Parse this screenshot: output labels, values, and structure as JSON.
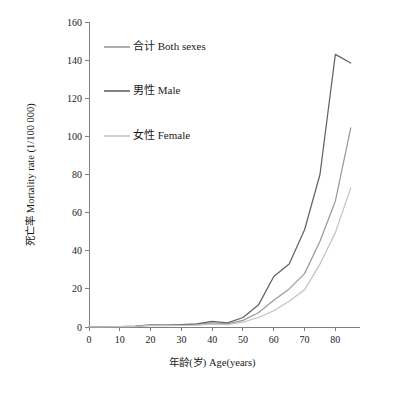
{
  "chart_data": {
    "type": "line",
    "title": "",
    "xlabel": "年龄(岁) Age(years)",
    "ylabel": "死亡率 Mortality rate (1/100 000)",
    "xlim": [
      0,
      88
    ],
    "ylim": [
      0,
      160
    ],
    "xticks": [
      0,
      10,
      20,
      30,
      40,
      50,
      60,
      70,
      80
    ],
    "xtick_labels": [
      "0",
      "10",
      "20",
      "30",
      "40",
      "50",
      "60",
      "70",
      "80"
    ],
    "yticks": [
      0,
      20,
      40,
      60,
      80,
      100,
      120,
      140,
      160
    ],
    "ytick_labels": [
      "0",
      "20",
      "40",
      "60",
      "80",
      "100",
      "120",
      "140",
      "160"
    ],
    "grid": false,
    "legend_position": "upper-left-inside",
    "x": [
      0,
      5,
      10,
      15,
      20,
      25,
      30,
      35,
      40,
      45,
      50,
      55,
      60,
      65,
      70,
      75,
      80,
      85
    ],
    "series": [
      {
        "name": "合计 Both sexes",
        "color": "#9b9b9b",
        "values": [
          0.1,
          0.1,
          0.2,
          0.3,
          0.9,
          0.8,
          1.0,
          1.2,
          2.2,
          1.6,
          3.5,
          7.5,
          14.0,
          20.0,
          28.0,
          45.0,
          66.0,
          104.5
        ]
      },
      {
        "name": "男性 Male",
        "color": "#636363",
        "values": [
          0.1,
          0.1,
          0.2,
          0.4,
          1.1,
          1.0,
          1.3,
          1.6,
          3.0,
          2.2,
          5.0,
          11.5,
          26.5,
          33.0,
          51.0,
          80.0,
          143.0,
          138.5
        ]
      },
      {
        "name": "女性 Female",
        "color": "#c4c4c4",
        "values": [
          0.1,
          0.1,
          0.2,
          0.3,
          0.8,
          0.7,
          0.8,
          1.0,
          1.5,
          1.2,
          2.5,
          5.0,
          8.5,
          13.5,
          19.5,
          33.0,
          49.5,
          73.0
        ]
      }
    ]
  }
}
